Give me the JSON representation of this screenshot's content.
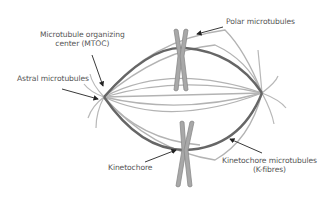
{
  "labels": {
    "mtoc_line1": "Microtubule organizing",
    "mtoc_line2": "center (MTOC)",
    "astral": "Astral microtubules",
    "polar": "Polar microtubules",
    "kinetochore": "Kinetochore",
    "kfibres_line1": "Kinetochore microtubules",
    "kfibres_line2": "(K-fibres)"
  },
  "colors": {
    "spindle_outline": "#666666",
    "microtubule": "#b3b3b3",
    "chromosome_fill": "#a8a8a8",
    "chromosome_stroke": "#888888",
    "arrow": "#222222",
    "text": "#555555"
  }
}
